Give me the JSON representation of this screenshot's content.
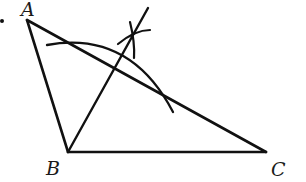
{
  "diagram": {
    "type": "geometry-construction",
    "labels": {
      "A": "A",
      "B": "B",
      "C": "C"
    },
    "points": {
      "A": [
        27,
        20
      ],
      "B": [
        68,
        152
      ],
      "C": [
        266,
        152
      ],
      "bisector_end": [
        148,
        8
      ]
    },
    "colors": {
      "ink": "#111111",
      "background": "#ffffff"
    },
    "bullet": "•"
  }
}
